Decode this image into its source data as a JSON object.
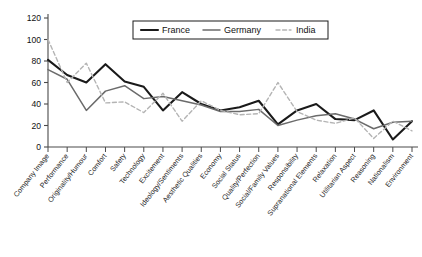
{
  "chart_data": {
    "type": "line",
    "title": "",
    "xlabel": "",
    "ylabel": "",
    "ylim": [
      0,
      120
    ],
    "ytick_step": 20,
    "yticks": [
      0,
      20,
      40,
      60,
      80,
      100,
      120
    ],
    "grid": false,
    "legend_position": "top-center",
    "categories": [
      "Company Image",
      "Performance",
      "Originality/Humour",
      "Comfort",
      "Safety",
      "Technology",
      "Excitement",
      "Ideology/Sentiments",
      "Aesthetic Qualities",
      "Economy",
      "Social Status",
      "Quality/Perfection",
      "Social/Family Values",
      "Responsibility",
      "Supranational Elements",
      "Relaxation",
      "Utilitarian Aspect",
      "Reasoning",
      "Nationalism",
      "Environment"
    ],
    "series": [
      {
        "name": "France",
        "color": "#1a1a1a",
        "style": "solid",
        "width": 2.1,
        "values": [
          81,
          67,
          60,
          77,
          61,
          56,
          34,
          51,
          40,
          34,
          37,
          43,
          21,
          34,
          40,
          26,
          25,
          34,
          7,
          24
        ]
      },
      {
        "name": "Germany",
        "color": "#6b6b6b",
        "style": "solid",
        "width": 1.5,
        "values": [
          72,
          63,
          34,
          52,
          57,
          45,
          47,
          43,
          39,
          33,
          33,
          35,
          20,
          25,
          29,
          31,
          26,
          17,
          23,
          24
        ]
      },
      {
        "name": "India",
        "color": "#b4b4b4",
        "style": "dashed",
        "width": 1.4,
        "values": [
          100,
          60,
          78,
          41,
          42,
          32,
          50,
          24,
          43,
          34,
          30,
          31,
          60,
          33,
          25,
          22,
          27,
          8,
          24,
          15
        ]
      }
    ],
    "tail_values": {
      "France": 1,
      "Germany": 1,
      "India": 0
    }
  },
  "legend": {
    "items": [
      {
        "label": "France"
      },
      {
        "label": "Germany"
      },
      {
        "label": "India"
      }
    ]
  }
}
